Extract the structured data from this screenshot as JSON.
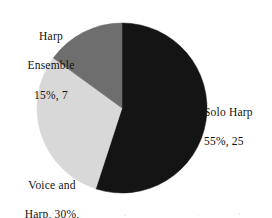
{
  "chart_data": {
    "type": "pie",
    "title": "",
    "labels": [
      "Solo Harp",
      "Voice and Harp",
      "Harp Ensemble"
    ],
    "values": [
      25,
      14,
      7
    ],
    "percentages": [
      55,
      30,
      15
    ],
    "total": 46,
    "colors": [
      "#141414",
      "#d8d8d8",
      "#6e6e6e"
    ],
    "background": "#ffffff",
    "legend": "none",
    "labels_position": "outside",
    "start_angle_deg": 0,
    "direction": "clockwise",
    "slices": [
      {
        "name": "Solo Harp",
        "value": 25,
        "percent": 55,
        "color": "#141414",
        "label_lines": [
          "Solo Harp",
          "55%, 25"
        ]
      },
      {
        "name": "Voice and Harp",
        "value": 14,
        "percent": 30,
        "color": "#d8d8d8",
        "label_lines": [
          "Voice and",
          "Harp, 30%,",
          "14"
        ]
      },
      {
        "name": "Harp Ensemble",
        "value": 7,
        "percent": 15,
        "color": "#6e6e6e",
        "label_lines": [
          "Harp",
          "Ensemble",
          "15%, 7"
        ]
      }
    ]
  },
  "labels": {
    "harp_ensemble": {
      "line1": "Harp",
      "line2": "Ensemble",
      "line3": "15%, 7"
    },
    "solo_harp": {
      "line1": "Solo Harp",
      "line2": "55%, 25"
    },
    "voice_and_harp": {
      "line1": "Voice and",
      "line2": "Harp, 30%,",
      "line3": "14"
    }
  },
  "geometry": {
    "center_x": 122,
    "center_y": 108,
    "radius": 85
  }
}
